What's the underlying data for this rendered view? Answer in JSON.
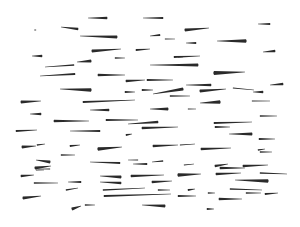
{
  "canvas": {
    "width": 300,
    "height": 227,
    "background": "#ffffff",
    "ink": "#2a2a2a"
  },
  "strokes": [
    {
      "x1": 107,
      "y1": 18,
      "x2": 88,
      "y2": 18,
      "w": 2.6
    },
    {
      "x1": 163,
      "y1": 18,
      "x2": 143,
      "y2": 18,
      "w": 2.2
    },
    {
      "x1": 270,
      "y1": 24,
      "x2": 258,
      "y2": 24,
      "w": 2.2
    },
    {
      "x1": 36,
      "y1": 30,
      "x2": 34,
      "y2": 30,
      "w": 1.2
    },
    {
      "x1": 78,
      "y1": 29,
      "x2": 61,
      "y2": 27,
      "w": 2.4
    },
    {
      "x1": 117,
      "y1": 37,
      "x2": 80,
      "y2": 36,
      "w": 2.8
    },
    {
      "x1": 185,
      "y1": 30,
      "x2": 209,
      "y2": 28,
      "w": 3.0
    },
    {
      "x1": 160,
      "y1": 35,
      "x2": 150,
      "y2": 36,
      "w": 2.0
    },
    {
      "x1": 165,
      "y1": 39,
      "x2": 175,
      "y2": 39,
      "w": 1.2
    },
    {
      "x1": 196,
      "y1": 43,
      "x2": 186,
      "y2": 43,
      "w": 2.0
    },
    {
      "x1": 246,
      "y1": 41,
      "x2": 217,
      "y2": 41,
      "w": 3.6
    },
    {
      "x1": 92,
      "y1": 51,
      "x2": 121,
      "y2": 49,
      "w": 3.0
    },
    {
      "x1": 136,
      "y1": 50,
      "x2": 150,
      "y2": 49,
      "w": 2.2
    },
    {
      "x1": 42,
      "y1": 56,
      "x2": 32,
      "y2": 56,
      "w": 2.4
    },
    {
      "x1": 91,
      "y1": 61,
      "x2": 77,
      "y2": 62,
      "w": 3.0
    },
    {
      "x1": 74,
      "y1": 65,
      "x2": 45,
      "y2": 67,
      "w": 1.6
    },
    {
      "x1": 115,
      "y1": 58,
      "x2": 125,
      "y2": 58,
      "w": 1.6
    },
    {
      "x1": 178,
      "y1": 57,
      "x2": 183,
      "y2": 57,
      "w": 1.0
    },
    {
      "x1": 275,
      "y1": 51,
      "x2": 263,
      "y2": 52,
      "w": 2.4
    },
    {
      "x1": 174,
      "y1": 57,
      "x2": 200,
      "y2": 56,
      "w": 2.0
    },
    {
      "x1": 198,
      "y1": 65,
      "x2": 150,
      "y2": 65,
      "w": 2.8
    },
    {
      "x1": 75,
      "y1": 74,
      "x2": 40,
      "y2": 76,
      "w": 2.0
    },
    {
      "x1": 98,
      "y1": 75,
      "x2": 125,
      "y2": 75,
      "w": 2.4
    },
    {
      "x1": 126,
      "y1": 81,
      "x2": 145,
      "y2": 80,
      "w": 2.4
    },
    {
      "x1": 147,
      "y1": 80,
      "x2": 173,
      "y2": 80,
      "w": 2.0
    },
    {
      "x1": 214,
      "y1": 73,
      "x2": 245,
      "y2": 72,
      "w": 3.8
    },
    {
      "x1": 91,
      "y1": 90,
      "x2": 60,
      "y2": 89,
      "w": 3.6
    },
    {
      "x1": 125,
      "y1": 92,
      "x2": 135,
      "y2": 92,
      "w": 2.2
    },
    {
      "x1": 142,
      "y1": 90,
      "x2": 153,
      "y2": 90,
      "w": 2.0
    },
    {
      "x1": 183,
      "y1": 89,
      "x2": 153,
      "y2": 94,
      "w": 3.2
    },
    {
      "x1": 211,
      "y1": 85,
      "x2": 186,
      "y2": 85,
      "w": 2.4
    },
    {
      "x1": 200,
      "y1": 91,
      "x2": 226,
      "y2": 89,
      "w": 3.0
    },
    {
      "x1": 263,
      "y1": 92,
      "x2": 253,
      "y2": 92,
      "w": 2.4
    },
    {
      "x1": 283,
      "y1": 84,
      "x2": 270,
      "y2": 85,
      "w": 2.4
    },
    {
      "x1": 21,
      "y1": 102,
      "x2": 41,
      "y2": 101,
      "w": 2.8
    },
    {
      "x1": 83,
      "y1": 102,
      "x2": 135,
      "y2": 100,
      "w": 2.2
    },
    {
      "x1": 170,
      "y1": 96,
      "x2": 190,
      "y2": 96,
      "w": 1.6
    },
    {
      "x1": 233,
      "y1": 88,
      "x2": 254,
      "y2": 90,
      "w": 1.2
    },
    {
      "x1": 220,
      "y1": 102,
      "x2": 200,
      "y2": 103,
      "w": 3.6
    },
    {
      "x1": 252,
      "y1": 101,
      "x2": 270,
      "y2": 101,
      "w": 1.2
    },
    {
      "x1": 41,
      "y1": 114,
      "x2": 30,
      "y2": 114,
      "w": 2.4
    },
    {
      "x1": 109,
      "y1": 110,
      "x2": 90,
      "y2": 110,
      "w": 2.4
    },
    {
      "x1": 168,
      "y1": 109,
      "x2": 150,
      "y2": 109,
      "w": 3.0
    },
    {
      "x1": 188,
      "y1": 109,
      "x2": 196,
      "y2": 109,
      "w": 1.2
    },
    {
      "x1": 54,
      "y1": 121,
      "x2": 89,
      "y2": 121,
      "w": 2.4
    },
    {
      "x1": 106,
      "y1": 120,
      "x2": 138,
      "y2": 120,
      "w": 2.2
    },
    {
      "x1": 158,
      "y1": 122,
      "x2": 128,
      "y2": 124,
      "w": 2.4
    },
    {
      "x1": 214,
      "y1": 123,
      "x2": 252,
      "y2": 122,
      "w": 2.2
    },
    {
      "x1": 260,
      "y1": 116,
      "x2": 277,
      "y2": 116,
      "w": 1.4
    },
    {
      "x1": 16,
      "y1": 131,
      "x2": 37,
      "y2": 130,
      "w": 2.0
    },
    {
      "x1": 100,
      "y1": 131,
      "x2": 70,
      "y2": 131,
      "w": 2.0
    },
    {
      "x1": 126,
      "y1": 135,
      "x2": 132,
      "y2": 134,
      "w": 1.8
    },
    {
      "x1": 142,
      "y1": 128,
      "x2": 178,
      "y2": 127,
      "w": 2.4
    },
    {
      "x1": 215,
      "y1": 127,
      "x2": 230,
      "y2": 127,
      "w": 2.0
    },
    {
      "x1": 252,
      "y1": 134,
      "x2": 229,
      "y2": 134,
      "w": 2.8
    },
    {
      "x1": 259,
      "y1": 139,
      "x2": 275,
      "y2": 139,
      "w": 2.0
    },
    {
      "x1": 22,
      "y1": 147,
      "x2": 36,
      "y2": 146,
      "w": 2.8
    },
    {
      "x1": 37,
      "y1": 145,
      "x2": 45,
      "y2": 144,
      "w": 1.6
    },
    {
      "x1": 61,
      "y1": 155,
      "x2": 75,
      "y2": 155,
      "w": 1.6
    },
    {
      "x1": 70,
      "y1": 146,
      "x2": 80,
      "y2": 145,
      "w": 2.0
    },
    {
      "x1": 98,
      "y1": 149,
      "x2": 122,
      "y2": 147,
      "w": 3.6
    },
    {
      "x1": 153,
      "y1": 146,
      "x2": 178,
      "y2": 145,
      "w": 2.4
    },
    {
      "x1": 180,
      "y1": 145,
      "x2": 195,
      "y2": 144,
      "w": 1.0
    },
    {
      "x1": 201,
      "y1": 149,
      "x2": 231,
      "y2": 148,
      "w": 2.4
    },
    {
      "x1": 258,
      "y1": 150,
      "x2": 265,
      "y2": 149,
      "w": 1.4
    },
    {
      "x1": 260,
      "y1": 152,
      "x2": 272,
      "y2": 152,
      "w": 1.4
    },
    {
      "x1": 163,
      "y1": 161,
      "x2": 152,
      "y2": 162,
      "w": 1.6
    },
    {
      "x1": 138,
      "y1": 160,
      "x2": 128,
      "y2": 160,
      "w": 1.0
    },
    {
      "x1": 120,
      "y1": 163,
      "x2": 90,
      "y2": 162,
      "w": 2.0
    },
    {
      "x1": 147,
      "y1": 164,
      "x2": 133,
      "y2": 164,
      "w": 2.0
    },
    {
      "x1": 184,
      "y1": 165,
      "x2": 194,
      "y2": 164,
      "w": 1.2
    },
    {
      "x1": 215,
      "y1": 166,
      "x2": 228,
      "y2": 164,
      "w": 2.6
    },
    {
      "x1": 243,
      "y1": 166,
      "x2": 268,
      "y2": 165,
      "w": 2.6
    },
    {
      "x1": 50,
      "y1": 162,
      "x2": 36,
      "y2": 160,
      "w": 2.8
    },
    {
      "x1": 50,
      "y1": 169,
      "x2": 38,
      "y2": 169,
      "w": 1.2
    },
    {
      "x1": 36,
      "y1": 170,
      "x2": 44,
      "y2": 170,
      "w": 1.0
    },
    {
      "x1": 21,
      "y1": 176,
      "x2": 34,
      "y2": 175,
      "w": 2.4
    },
    {
      "x1": 121,
      "y1": 177,
      "x2": 100,
      "y2": 176,
      "w": 3.0
    },
    {
      "x1": 131,
      "y1": 176,
      "x2": 164,
      "y2": 175,
      "w": 2.6
    },
    {
      "x1": 178,
      "y1": 175,
      "x2": 201,
      "y2": 174,
      "w": 3.4
    },
    {
      "x1": 216,
      "y1": 174,
      "x2": 241,
      "y2": 173,
      "w": 2.6
    },
    {
      "x1": 35,
      "y1": 168,
      "x2": 51,
      "y2": 166,
      "w": 3.0
    },
    {
      "x1": 220,
      "y1": 168,
      "x2": 245,
      "y2": 168,
      "w": 2.4
    },
    {
      "x1": 260,
      "y1": 173,
      "x2": 287,
      "y2": 174,
      "w": 1.6
    },
    {
      "x1": 34,
      "y1": 183,
      "x2": 58,
      "y2": 183,
      "w": 1.6
    },
    {
      "x1": 81,
      "y1": 182,
      "x2": 68,
      "y2": 182,
      "w": 2.0
    },
    {
      "x1": 121,
      "y1": 183,
      "x2": 100,
      "y2": 182,
      "w": 2.4
    },
    {
      "x1": 152,
      "y1": 182,
      "x2": 172,
      "y2": 181,
      "w": 2.4
    },
    {
      "x1": 268,
      "y1": 181,
      "x2": 235,
      "y2": 180,
      "w": 3.6
    },
    {
      "x1": 66,
      "y1": 190,
      "x2": 78,
      "y2": 188,
      "w": 1.6
    },
    {
      "x1": 188,
      "y1": 190,
      "x2": 195,
      "y2": 189,
      "w": 2.0
    },
    {
      "x1": 230,
      "y1": 189,
      "x2": 262,
      "y2": 190,
      "w": 1.4
    },
    {
      "x1": 103,
      "y1": 190,
      "x2": 145,
      "y2": 188,
      "w": 1.6
    },
    {
      "x1": 158,
      "y1": 190,
      "x2": 170,
      "y2": 190,
      "w": 1.4
    },
    {
      "x1": 208,
      "y1": 193,
      "x2": 215,
      "y2": 193,
      "w": 1.6
    },
    {
      "x1": 265,
      "y1": 194,
      "x2": 278,
      "y2": 193,
      "w": 2.0
    },
    {
      "x1": 246,
      "y1": 193,
      "x2": 261,
      "y2": 193,
      "w": 1.6
    },
    {
      "x1": 23,
      "y1": 198,
      "x2": 41,
      "y2": 196,
      "w": 3.2
    },
    {
      "x1": 104,
      "y1": 196,
      "x2": 171,
      "y2": 194,
      "w": 2.2
    },
    {
      "x1": 178,
      "y1": 196,
      "x2": 196,
      "y2": 196,
      "w": 1.8
    },
    {
      "x1": 219,
      "y1": 199,
      "x2": 242,
      "y2": 199,
      "w": 2.4
    },
    {
      "x1": 72,
      "y1": 209,
      "x2": 81,
      "y2": 206,
      "w": 3.0
    },
    {
      "x1": 85,
      "y1": 205,
      "x2": 95,
      "y2": 205,
      "w": 1.4
    },
    {
      "x1": 165,
      "y1": 206,
      "x2": 142,
      "y2": 205,
      "w": 2.8
    },
    {
      "x1": 207,
      "y1": 209,
      "x2": 214,
      "y2": 209,
      "w": 2.2
    }
  ]
}
